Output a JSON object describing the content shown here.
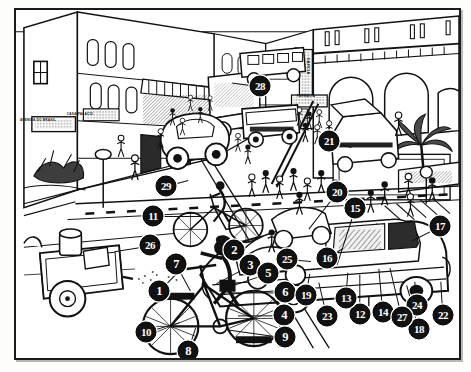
{
  "figure": {
    "type": "line-art-illustration",
    "frame": {
      "border_color": "#1b1b1b",
      "background": "#ffffff"
    },
    "marker_style": {
      "fill": "#111111",
      "text_color": "#ffffff",
      "shape": "circle"
    }
  },
  "signs": [
    {
      "name": "street-name-sign",
      "text": "AVENIDA DO BRASIL",
      "x": 36,
      "y": 118
    },
    {
      "name": "shop-sign-left",
      "text": "CASA PALACIO",
      "x": 78,
      "y": 112
    },
    {
      "name": "vertical-sign",
      "text": "GARCIA",
      "x": 306,
      "y": 64
    },
    {
      "name": "pharmacy-sign",
      "text": "FARMACIA",
      "x": 304,
      "y": 94
    }
  ],
  "callouts": [
    {
      "n": "1",
      "x": 157,
      "y": 289,
      "lx": 26,
      "ly": -26
    },
    {
      "n": "2",
      "x": 232,
      "y": 248,
      "lx": 26,
      "ly": 24
    },
    {
      "n": "3",
      "x": 248,
      "y": 263,
      "lx": -34,
      "ly": 18
    },
    {
      "n": "4",
      "x": 282,
      "y": 313,
      "lx": -46,
      "ly": 0
    },
    {
      "n": "5",
      "x": 266,
      "y": 271,
      "lx": -42,
      "ly": 14
    },
    {
      "n": "6",
      "x": 283,
      "y": 290,
      "lx": -62,
      "ly": 0
    },
    {
      "n": "7",
      "x": 174,
      "y": 262,
      "lx": 14,
      "ly": 26
    },
    {
      "n": "8",
      "x": 186,
      "y": 349,
      "lx": 8,
      "ly": -24
    },
    {
      "n": "9",
      "x": 283,
      "y": 335,
      "lx": -58,
      "ly": -8
    },
    {
      "n": "10",
      "x": 144,
      "y": 330,
      "lx": 34,
      "ly": -10
    },
    {
      "n": "11",
      "x": 151,
      "y": 214,
      "lx": 48,
      "ly": 0
    },
    {
      "n": "12",
      "x": 358,
      "y": 312,
      "lx": 0,
      "ly": -40
    },
    {
      "n": "13",
      "x": 344,
      "y": 296,
      "lx": 2,
      "ly": -26
    },
    {
      "n": "14",
      "x": 381,
      "y": 310,
      "lx": -4,
      "ly": -44
    },
    {
      "n": "15",
      "x": 353,
      "y": 206,
      "lx": -18,
      "ly": 56
    },
    {
      "n": "16",
      "x": 325,
      "y": 256,
      "lx": 16,
      "ly": -10
    },
    {
      "n": "17",
      "x": 438,
      "y": 224,
      "lx": -28,
      "ly": 14
    },
    {
      "n": "18",
      "x": 417,
      "y": 327,
      "lx": -12,
      "ly": -44
    },
    {
      "n": "19",
      "x": 304,
      "y": 293,
      "lx": 4,
      "ly": -22
    },
    {
      "n": "20",
      "x": 335,
      "y": 190,
      "lx": -28,
      "ly": 36
    },
    {
      "n": "21",
      "x": 327,
      "y": 139,
      "lx": 22,
      "ly": 6
    },
    {
      "n": "22",
      "x": 441,
      "y": 313,
      "lx": -2,
      "ly": -34
    },
    {
      "n": "23",
      "x": 325,
      "y": 314,
      "lx": -8,
      "ly": -34
    },
    {
      "n": "24",
      "x": 415,
      "y": 303,
      "lx": -2,
      "ly": -24
    },
    {
      "n": "25",
      "x": 285,
      "y": 257,
      "lx": 24,
      "ly": 2
    },
    {
      "n": "26",
      "x": 148,
      "y": 243,
      "lx": -36,
      "ly": 6
    },
    {
      "n": "27",
      "x": 400,
      "y": 315,
      "lx": -12,
      "ly": -50
    },
    {
      "n": "28",
      "x": 258,
      "y": 84,
      "lx": -28,
      "ly": -4
    },
    {
      "n": "29",
      "x": 164,
      "y": 184,
      "lx": 22,
      "ly": -6
    }
  ]
}
